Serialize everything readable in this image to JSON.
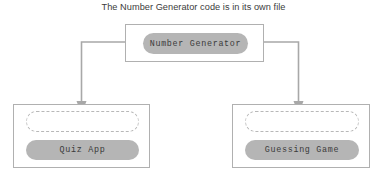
{
  "title": "The Number Generator code is in its own file",
  "colors": {
    "background": "#ffffff",
    "box_border": "#b0b0b0",
    "pill_fill": "#b5b5b5",
    "pill_text": "#3a3a3a",
    "dashed_border": "#b8b8b8",
    "connector": "#a8a8a8",
    "title_text": "#3b3b3b"
  },
  "boxes": [
    {
      "id": "number-generator",
      "pill_label": "Number Generator",
      "has_placeholder": false
    },
    {
      "id": "quiz-app",
      "pill_label": "Quiz App",
      "has_placeholder": true
    },
    {
      "id": "guessing-game",
      "pill_label": "Guessing Game",
      "has_placeholder": true
    }
  ],
  "connectors": [
    {
      "id": "number-generator-to-quiz-app",
      "from": "number-generator",
      "to": "quiz-app",
      "arrow": "down"
    },
    {
      "id": "number-generator-to-guessing-game",
      "from": "number-generator",
      "to": "guessing-game",
      "arrow": "down"
    }
  ]
}
